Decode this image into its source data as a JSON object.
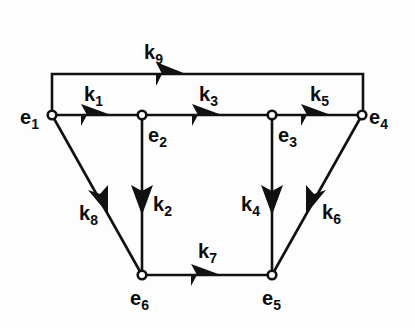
{
  "diagram": {
    "type": "directed-graph",
    "title": "",
    "background_color": "#fdfdfd",
    "line_color": "#111111",
    "node_fill_color": "#ffffff",
    "nodes": [
      {
        "id": "e1",
        "base": "e",
        "subscript": "1",
        "label": "e1",
        "x": 52,
        "y": 115,
        "label_x": 20,
        "label_y": 124
      },
      {
        "id": "e2",
        "base": "e",
        "subscript": "2",
        "label": "e2",
        "x": 142,
        "y": 115,
        "label_x": 148,
        "label_y": 142
      },
      {
        "id": "e3",
        "base": "e",
        "subscript": "3",
        "label": "e3",
        "x": 272,
        "y": 115,
        "label_x": 278,
        "label_y": 142
      },
      {
        "id": "e4",
        "base": "e",
        "subscript": "4",
        "label": "e4",
        "x": 362,
        "y": 115,
        "label_x": 369,
        "label_y": 124
      },
      {
        "id": "e5",
        "base": "e",
        "subscript": "5",
        "label": "e5",
        "x": 272,
        "y": 275,
        "label_x": 262,
        "label_y": 305
      },
      {
        "id": "e6",
        "base": "e",
        "subscript": "6",
        "label": "e6",
        "x": 142,
        "y": 275,
        "label_x": 130,
        "label_y": 305
      }
    ],
    "edges": [
      {
        "id": "k1",
        "base": "k",
        "subscript": "1",
        "label": "k1",
        "from": "e1",
        "to": "e2",
        "label_x": 84,
        "label_y": 101
      },
      {
        "id": "k2",
        "base": "k",
        "subscript": "2",
        "label": "k2",
        "from": "e2",
        "to": "e6",
        "label_x": 153,
        "label_y": 211
      },
      {
        "id": "k3",
        "base": "k",
        "subscript": "3",
        "label": "k3",
        "from": "e2",
        "to": "e3",
        "label_x": 199,
        "label_y": 101
      },
      {
        "id": "k4",
        "base": "k",
        "subscript": "4",
        "label": "k4",
        "from": "e3",
        "to": "e5",
        "label_x": 241,
        "label_y": 211
      },
      {
        "id": "k5",
        "base": "k",
        "subscript": "5",
        "label": "k5",
        "from": "e3",
        "to": "e4",
        "label_x": 310,
        "label_y": 101
      },
      {
        "id": "k6",
        "base": "k",
        "subscript": "6",
        "label": "k6",
        "from": "e4",
        "to": "e5",
        "label_x": 322,
        "label_y": 219
      },
      {
        "id": "k7",
        "base": "k",
        "subscript": "7",
        "label": "k7",
        "from": "e6",
        "to": "e5",
        "label_x": 198,
        "label_y": 258
      },
      {
        "id": "k8",
        "base": "k",
        "subscript": "8",
        "label": "k8",
        "from": "e1",
        "to": "e6",
        "label_x": 79,
        "label_y": 220
      },
      {
        "id": "k9",
        "base": "k",
        "subscript": "9",
        "label": "k9",
        "from": "e1",
        "to": "e4",
        "label_x": 144,
        "label_y": 59
      }
    ]
  }
}
